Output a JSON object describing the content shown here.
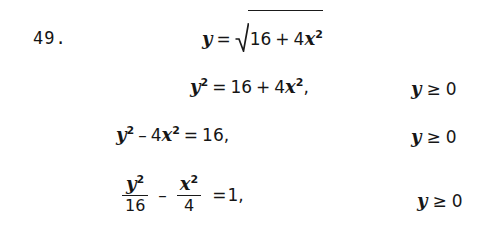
{
  "document": {
    "kind": "math-worked-solution",
    "background_color": "#ffffff",
    "ink_color": "#161616"
  },
  "problem": {
    "number_label": "49."
  },
  "steps": [
    {
      "id": "step-1",
      "lhs_variable": "y",
      "relation": "=",
      "rhs_kind": "square-root",
      "radicand": {
        "terms": [
          {
            "coefficient": "16",
            "variable": "",
            "exponent": ""
          },
          {
            "operator": "+",
            "coefficient": "4",
            "variable": "x",
            "exponent": "2"
          }
        ]
      },
      "constraint": null,
      "plain_text": "y = sqrt(16 + 4x^2)"
    },
    {
      "id": "step-2",
      "lhs_variable": "y",
      "lhs_exponent": "2",
      "relation": "=",
      "rhs_terms": [
        {
          "operator": "",
          "coefficient": "16",
          "variable": "",
          "exponent": ""
        },
        {
          "operator": "+",
          "coefficient": "4",
          "variable": "x",
          "exponent": "2"
        }
      ],
      "trailing_punctuation": ",",
      "constraint": {
        "variable": "y",
        "relation": "≥",
        "value": "0"
      },
      "plain_text": "y^2 = 16 + 4x^2,   y >= 0"
    },
    {
      "id": "step-3",
      "lhs_terms": [
        {
          "operator": "",
          "coefficient": "",
          "variable": "y",
          "exponent": "2"
        },
        {
          "operator": "–",
          "coefficient": "4",
          "variable": "x",
          "exponent": "2"
        }
      ],
      "relation": "=",
      "rhs_value": "16",
      "trailing_punctuation": ",",
      "constraint": {
        "variable": "y",
        "relation": "≥",
        "value": "0"
      },
      "plain_text": "y^2 - 4x^2 = 16,   y >= 0"
    },
    {
      "id": "step-4",
      "fractions": [
        {
          "numerator_variable": "y",
          "numerator_exponent": "2",
          "denominator": "16"
        },
        {
          "operator": "–",
          "numerator_variable": "x",
          "numerator_exponent": "2",
          "denominator": "4"
        }
      ],
      "relation": "=",
      "rhs_value": "1",
      "trailing_punctuation": ",",
      "constraint": {
        "variable": "y",
        "relation": "≥",
        "value": "0"
      },
      "plain_text": "y^2/16 - x^2/4 = 1,   y >= 0"
    }
  ],
  "symbols": {
    "equals": "=",
    "plus": "+",
    "minus": "–",
    "greater_equal": "≥",
    "comma": ",",
    "radical": "radical-sign"
  }
}
